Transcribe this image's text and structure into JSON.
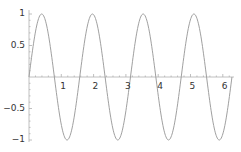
{
  "chart_data": {
    "type": "line",
    "title": "",
    "xlabel": "",
    "ylabel": "",
    "function": "sin(4x)",
    "xlim": [
      0,
      6.2832
    ],
    "ylim": [
      -1,
      1
    ],
    "grid": false,
    "legend": null,
    "x_ticks": [
      1,
      2,
      3,
      4,
      5,
      6
    ],
    "x_tick_labels": [
      "1",
      "2",
      "3",
      "4",
      "5",
      "6"
    ],
    "y_ticks": [
      1,
      0.5,
      -0.5,
      -1
    ],
    "y_tick_labels": [
      "1",
      "0.5",
      "−0.5",
      "−1"
    ],
    "series": [
      {
        "name": "sin(4x)",
        "color": "#999999",
        "x": [
          0,
          0.3927,
          0.7854,
          1.1781,
          1.5708,
          1.9635,
          2.3562,
          2.7489,
          3.1416,
          3.5343,
          3.927,
          4.3197,
          4.7124,
          5.1051,
          5.4978,
          5.8905,
          6.2832
        ],
        "values": [
          0,
          1,
          0,
          -1,
          0,
          1,
          0,
          -1,
          0,
          1,
          0,
          -1,
          0,
          1,
          0,
          -1,
          0
        ]
      }
    ]
  },
  "axes": {
    "color": "#b0b0b0",
    "curve_color": "#a0a0a0"
  }
}
